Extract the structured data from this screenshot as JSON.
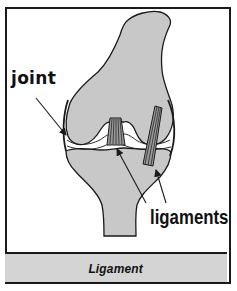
{
  "figure": {
    "caption": "Ligament",
    "labels": {
      "joint": "joint",
      "ligaments": "ligaments"
    },
    "colors": {
      "bone_fill": "#c8c8c8",
      "outline": "#1a1a1a",
      "caption_bg": "#d4d4d4",
      "background": "#ffffff"
    },
    "parts": [
      "femur",
      "tibia",
      "cruciate-ligament",
      "collateral-ligament",
      "joint-space"
    ]
  }
}
